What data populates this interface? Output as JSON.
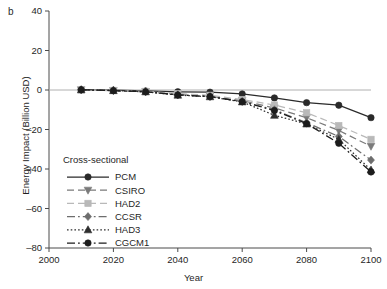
{
  "panel": {
    "label": "b"
  },
  "chart_data": {
    "type": "line",
    "title": "",
    "xlabel": "Year",
    "ylabel": "Energy Impact (Billion USD)",
    "xlim": [
      2000,
      2100
    ],
    "ylim": [
      -80,
      40
    ],
    "xticks": [
      2000,
      2020,
      2040,
      2060,
      2080,
      2100
    ],
    "yticks": [
      40,
      20,
      0,
      -20,
      -40,
      -60,
      -80
    ],
    "grid": false,
    "zero_line": true,
    "legend_position": "lower-left-inside",
    "legend_title": "Cross-sectional",
    "x": [
      2010,
      2020,
      2030,
      2040,
      2050,
      2060,
      2070,
      2080,
      2090,
      2100
    ],
    "series": [
      {
        "name": "PCM",
        "marker": "circle",
        "line": "solid",
        "color": "#2a2a2a",
        "values": [
          0.2,
          -0.1,
          -0.5,
          -0.9,
          -1.1,
          -2.0,
          -4.0,
          -6.4,
          -7.7,
          -14.0
        ]
      },
      {
        "name": "CSIRO",
        "marker": "triangle-down",
        "line": "dashed",
        "color": "#7a7a7a",
        "values": [
          0.1,
          -0.3,
          -0.8,
          -2.1,
          -3.1,
          -5.4,
          -9.1,
          -14.0,
          -20.5,
          -28.5
        ]
      },
      {
        "name": "HAD2",
        "marker": "square",
        "line": "dashed",
        "color": "#b9b9b9",
        "values": [
          0.1,
          -0.2,
          -0.7,
          -1.8,
          -2.7,
          -4.8,
          -7.6,
          -11.5,
          -18.0,
          -25.0
        ]
      },
      {
        "name": "CCSR",
        "marker": "diamond",
        "line": "dash-dot",
        "color": "#6d6d6d",
        "values": [
          0.1,
          -0.3,
          -0.9,
          -2.4,
          -3.4,
          -5.8,
          -10.0,
          -16.6,
          -23.5,
          -35.5
        ]
      },
      {
        "name": "HAD3",
        "marker": "triangle-up",
        "line": "dotted",
        "color": "#2e2e2e",
        "values": [
          0.1,
          -0.3,
          -0.9,
          -2.6,
          -3.4,
          -6.0,
          -12.8,
          -17.2,
          -25.0,
          -40.5
        ]
      },
      {
        "name": "CGCM1",
        "marker": "circle",
        "line": "dash-dot",
        "color": "#1c1c1c",
        "values": [
          0.1,
          -0.3,
          -0.9,
          -2.5,
          -3.3,
          -5.9,
          -10.4,
          -17.0,
          -27.0,
          -41.5
        ]
      }
    ]
  }
}
